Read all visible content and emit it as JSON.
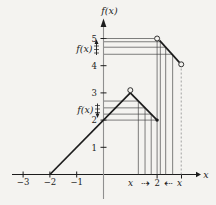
{
  "figure": {
    "width": 216,
    "height": 205,
    "background": "#f4f3f0"
  },
  "chart_data": {
    "type": "line",
    "title": "",
    "xlabel": "x",
    "ylabel": "f(x)",
    "xlim": [
      -3.4,
      3.9
    ],
    "ylim": [
      -1.1,
      5.8
    ],
    "grid": false,
    "legend": "none",
    "x_tick_labels": [
      {
        "value": -3,
        "label": "−3"
      },
      {
        "value": -2,
        "label": "−2"
      },
      {
        "value": -1,
        "label": "−1"
      }
    ],
    "y_tick_labels": [
      {
        "value": 1,
        "label": "1"
      },
      {
        "value": 2,
        "label": "2"
      },
      {
        "value": 3,
        "label": "3"
      },
      {
        "value": 4,
        "label": "4"
      },
      {
        "value": 5,
        "label": "5"
      }
    ],
    "extra_x_ticks": [
      2,
      2.91
    ],
    "series": [
      {
        "name": "left-branch-rising",
        "points": [
          [
            -2,
            0
          ],
          [
            1,
            3
          ]
        ]
      },
      {
        "name": "left-branch-falling",
        "points": [
          [
            1,
            3
          ],
          [
            2,
            2
          ]
        ]
      },
      {
        "name": "right-branch",
        "points": [
          [
            2.09,
            4.93
          ],
          [
            2.83,
            4.12
          ]
        ]
      }
    ],
    "open_points": [
      {
        "name": "open-circle-apex",
        "x": 1,
        "y": 3.1
      },
      {
        "name": "open-circle-left-limit",
        "x": 2,
        "y": 5
      },
      {
        "name": "open-circle-right-end",
        "x": 2.9,
        "y": 4.05
      }
    ],
    "solid_points": [
      {
        "name": "solid-dot-f-of-2",
        "x": 2,
        "y": 2
      }
    ],
    "guides": {
      "horizontal_to_y_axis": [
        {
          "y": 5.0,
          "x": 1.9
        },
        {
          "y": 4.88,
          "x": 2.12
        },
        {
          "y": 4.68,
          "x": 2.32
        },
        {
          "y": 4.42,
          "x": 2.58
        },
        {
          "y": 2.7,
          "x": 1.3
        },
        {
          "y": 2.45,
          "x": 1.55
        },
        {
          "y": 2.22,
          "x": 1.78
        },
        {
          "y": 2.0,
          "x": 2.0
        }
      ],
      "vertical_to_x_axis": [
        {
          "x": 1.3,
          "y": 2.7
        },
        {
          "x": 1.55,
          "y": 2.45
        },
        {
          "x": 1.78,
          "y": 2.22
        },
        {
          "x": 2.0,
          "y": 4.9
        },
        {
          "x": 2.12,
          "y": 4.88
        },
        {
          "x": 2.32,
          "y": 4.68
        },
        {
          "x": 2.58,
          "y": 4.42
        }
      ],
      "dashed_vertical": {
        "x": 2.9,
        "y": 4.0
      }
    },
    "annotations": {
      "fx_upper": {
        "label": "f(x)",
        "glyph": "up-arrow-through-ticks",
        "near_y": 4.7
      },
      "fx_lower": {
        "label": "f(x)",
        "glyph": "down-arrow-through-ticks",
        "near_y": 2.5
      },
      "x_approach": {
        "left_label": "x",
        "left_arrow": "⇢",
        "center_label": "2",
        "right_arrow": "⇠",
        "right_label": "x"
      }
    },
    "colors": {
      "curve": "#1c1c1c",
      "guide": "#3d3d3d",
      "x_axis": "#1c1c1c",
      "y_axis": "#8f8f8f",
      "dashed": "#9a9a9a",
      "text": "#1c1c1c",
      "point_fill": "#f4f3f0"
    }
  }
}
